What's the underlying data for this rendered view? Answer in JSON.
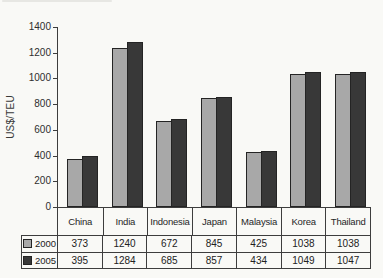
{
  "chart_data": {
    "type": "bar",
    "ylabel": "US$/TEU",
    "categories": [
      "China",
      "India",
      "Indonesia",
      "Japan",
      "Malaysia",
      "Korea",
      "Thailand"
    ],
    "series": [
      {
        "name": "2000",
        "color": "#a8a8a8",
        "values": [
          373,
          1240,
          672,
          845,
          425,
          1038,
          1038
        ]
      },
      {
        "name": "2005",
        "color": "#383838",
        "values": [
          395,
          1284,
          685,
          857,
          434,
          1049,
          1047
        ]
      }
    ],
    "yticks": [
      0,
      200,
      400,
      600,
      800,
      1000,
      1200,
      1400
    ],
    "ylim": [
      0,
      1400
    ],
    "grid": false,
    "legend_position": "table-left",
    "legend_items": [
      {
        "label": "2000",
        "swatch_color": "#a8a8a8"
      },
      {
        "label": "2005",
        "swatch_color": "#383838"
      }
    ]
  },
  "colors": {
    "background": "#f9f9f6",
    "axis_line": "#3d3d3d",
    "text": "#2a2a2a",
    "bar_border": "#242424",
    "series_2000": "#a8a8a8",
    "series_2005": "#383838"
  }
}
